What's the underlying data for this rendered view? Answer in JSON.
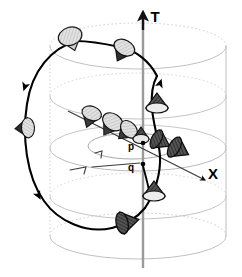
{
  "figure": {
    "kind": "spacetime-diagram",
    "width": 242,
    "height": 277,
    "background_color": "#ffffff"
  },
  "axes": {
    "time_axis": {
      "label": "T",
      "label_x": 155,
      "label_y": 22,
      "color": "#8c8c8c",
      "arrow_color": "#000000",
      "x": 143,
      "y_top": 12,
      "y_bottom": 268
    },
    "space_axis": {
      "label": "X",
      "label_x": 213,
      "label_y": 179,
      "color": "#3a3a3a",
      "x1": 68,
      "y1": 111,
      "x2": 207,
      "y2": 181
    }
  },
  "points": [
    {
      "name": "p",
      "label": "p",
      "label_x": 131,
      "label_y": 150,
      "cx": 143,
      "cy": 143,
      "marker": "dot"
    },
    {
      "name": "q",
      "label": "q",
      "label_x": 131,
      "label_y": 171,
      "cx": 143,
      "cy": 164,
      "marker": "dot"
    }
  ],
  "cylinder": {
    "color": "#b4b4b4",
    "wall_left_x": 50,
    "wall_right_x": 226,
    "center_x": 138,
    "rx": 88,
    "ry": 23,
    "rings": [
      {
        "name": "top-rim",
        "cy": 46,
        "rx": 88,
        "ry": 23,
        "dashed_back": true
      },
      {
        "name": "upper-ring",
        "cy": 96,
        "rx": 88,
        "ry": 23,
        "dashed_back": false
      },
      {
        "name": "middle-ring",
        "cy": 148,
        "rx": 88,
        "ry": 23,
        "dashed_back": false
      },
      {
        "name": "lower-ring",
        "cy": 196,
        "rx": 88,
        "ry": 23,
        "dashed_back": false
      },
      {
        "name": "bottom-rim",
        "cy": 236,
        "rx": 88,
        "ry": 23,
        "dashed_back": true
      }
    ],
    "inner_ring": {
      "name": "inner-ring",
      "cx": 132,
      "cy": 146,
      "rx": 44,
      "ry": 13
    }
  },
  "closed_timelike_curve": {
    "name": "closed-timelike-curve",
    "color": "#000000",
    "stroke_width": 2.1,
    "arrow_markers": [
      {
        "x": 38,
        "y": 86,
        "angle": 100
      },
      {
        "x": 45,
        "y": 197,
        "angle": 72
      },
      {
        "x": 156,
        "y": 85,
        "angle": -70
      }
    ]
  },
  "light_cones": [
    {
      "id": "cone-top-left",
      "x": 72,
      "y": 42,
      "rx": 13,
      "ry": 10,
      "rot": -20,
      "tilt_deg": 0,
      "shade": "light",
      "style": "ellipse-open"
    },
    {
      "id": "cone-upper-mid",
      "x": 122,
      "y": 52,
      "rx": 11,
      "ry": 8,
      "rot": -25,
      "tilt_deg": 35,
      "shade": "light",
      "style": "cone-down"
    },
    {
      "id": "cone-left-edge",
      "x": 23,
      "y": 128,
      "rx": 10,
      "ry": 7,
      "rot": 5,
      "tilt_deg": 85,
      "shade": "light",
      "style": "cone-right"
    },
    {
      "id": "cone-chain-1",
      "x": 90,
      "y": 118,
      "rx": 10,
      "ry": 8,
      "rot": -35,
      "tilt_deg": 25,
      "shade": "light",
      "style": "cone-down"
    },
    {
      "id": "cone-chain-2",
      "x": 110,
      "y": 126,
      "rx": 11,
      "ry": 8,
      "rot": -40,
      "tilt_deg": 40,
      "shade": "light",
      "style": "cone-down"
    },
    {
      "id": "cone-chain-3",
      "x": 124,
      "y": 131,
      "rx": 10,
      "ry": 7,
      "rot": -45,
      "tilt_deg": 55,
      "shade": "light",
      "style": "cone-down"
    },
    {
      "id": "cone-at-p",
      "x": 141,
      "y": 135,
      "rx": 8,
      "ry": 6,
      "rot": 0,
      "tilt_deg": 70,
      "shade": "dark",
      "style": "cone-down"
    },
    {
      "id": "cone-tipped-1",
      "x": 159,
      "y": 142,
      "rx": 10,
      "ry": 8,
      "rot": -30,
      "tilt_deg": 90,
      "shade": "dark",
      "style": "cone-x"
    },
    {
      "id": "cone-tipped-2",
      "x": 175,
      "y": 148,
      "rx": 11,
      "ry": 9,
      "rot": -30,
      "tilt_deg": 95,
      "shade": "dark",
      "style": "cone-x"
    },
    {
      "id": "cone-upper-right",
      "x": 157,
      "y": 104,
      "rx": 11,
      "ry": 8,
      "rot": 0,
      "tilt_deg": 80,
      "shade": "dark",
      "style": "cone-down"
    },
    {
      "id": "cone-lower-right",
      "x": 153,
      "y": 192,
      "rx": 11,
      "ry": 8,
      "rot": 0,
      "tilt_deg": 80,
      "shade": "dark",
      "style": "cone-down"
    },
    {
      "id": "cone-bottom",
      "x": 126,
      "y": 222,
      "rx": 11,
      "ry": 9,
      "rot": 25,
      "tilt_deg": 95,
      "shade": "dark",
      "style": "cone-left"
    }
  ],
  "colors": {
    "curve": "#000000",
    "cylinder_guide": "#b4b4b4",
    "cone_light_fill": "#d6d6d6",
    "cone_dark_fill": "#4a4a4a",
    "cone_stroke": "#000000",
    "time_axis": "#8c8c8c",
    "space_axis": "#3a3a3a",
    "label": "#000000"
  }
}
